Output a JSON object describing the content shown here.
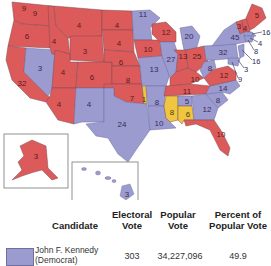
{
  "map": {
    "title": "1960 Presidential Election",
    "colors": {
      "democrat": "#9b9bd0",
      "republican": "#dd5a5a",
      "unpledged": "#f0c640"
    },
    "states": [
      {
        "abbr": "WA",
        "votes": "9",
        "party": "republican"
      },
      {
        "abbr": "OR",
        "votes": "6",
        "party": "republican"
      },
      {
        "abbr": "CA",
        "votes": "32",
        "party": "republican"
      },
      {
        "abbr": "NV",
        "votes": "3",
        "party": "democrat"
      },
      {
        "abbr": "ID",
        "votes": "4",
        "party": "republican"
      },
      {
        "abbr": "MT",
        "votes": "4",
        "party": "republican"
      },
      {
        "abbr": "WY",
        "votes": "3",
        "party": "republican"
      },
      {
        "abbr": "UT",
        "votes": "4",
        "party": "republican"
      },
      {
        "abbr": "CO",
        "votes": "6",
        "party": "republican"
      },
      {
        "abbr": "AZ",
        "votes": "4",
        "party": "republican"
      },
      {
        "abbr": "NM",
        "votes": "4",
        "party": "democrat"
      },
      {
        "abbr": "ND",
        "votes": "4",
        "party": "republican"
      },
      {
        "abbr": "SD",
        "votes": "4",
        "party": "republican"
      },
      {
        "abbr": "NE",
        "votes": "6",
        "party": "republican"
      },
      {
        "abbr": "KS",
        "votes": "8",
        "party": "republican"
      },
      {
        "abbr": "OK",
        "votes": "7",
        "party": "republican"
      },
      {
        "abbr": "OK-unpledged",
        "votes": "1",
        "party": "unpledged"
      },
      {
        "abbr": "TX",
        "votes": "24",
        "party": "democrat"
      },
      {
        "abbr": "MN",
        "votes": "11",
        "party": "democrat"
      },
      {
        "abbr": "IA",
        "votes": "10",
        "party": "republican"
      },
      {
        "abbr": "MO",
        "votes": "13",
        "party": "democrat"
      },
      {
        "abbr": "AR",
        "votes": "8",
        "party": "democrat"
      },
      {
        "abbr": "LA",
        "votes": "10",
        "party": "democrat"
      },
      {
        "abbr": "WI",
        "votes": "12",
        "party": "republican"
      },
      {
        "abbr": "IL",
        "votes": "27",
        "party": "democrat"
      },
      {
        "abbr": "MI",
        "votes": "20",
        "party": "democrat"
      },
      {
        "abbr": "IN",
        "votes": "13",
        "party": "republican"
      },
      {
        "abbr": "OH",
        "votes": "25",
        "party": "republican"
      },
      {
        "abbr": "KY",
        "votes": "10",
        "party": "republican"
      },
      {
        "abbr": "TN",
        "votes": "11",
        "party": "republican"
      },
      {
        "abbr": "MS",
        "votes": "8",
        "party": "unpledged"
      },
      {
        "abbr": "AL",
        "votes": "6",
        "party": "unpledged"
      },
      {
        "abbr": "AL-dem",
        "votes": "5",
        "party": "democrat"
      },
      {
        "abbr": "GA",
        "votes": "12",
        "party": "democrat"
      },
      {
        "abbr": "FL",
        "votes": "10",
        "party": "republican"
      },
      {
        "abbr": "SC",
        "votes": "8",
        "party": "democrat"
      },
      {
        "abbr": "NC",
        "votes": "14",
        "party": "democrat"
      },
      {
        "abbr": "VA",
        "votes": "12",
        "party": "republican"
      },
      {
        "abbr": "WV",
        "votes": "8",
        "party": "democrat"
      },
      {
        "abbr": "PA",
        "votes": "32",
        "party": "democrat"
      },
      {
        "abbr": "NY",
        "votes": "45",
        "party": "democrat"
      },
      {
        "abbr": "VT",
        "votes": "3",
        "party": "republican"
      },
      {
        "abbr": "NH",
        "votes": "4",
        "party": "republican"
      },
      {
        "abbr": "ME",
        "votes": "5",
        "party": "republican"
      },
      {
        "abbr": "MA",
        "votes": "16",
        "party": "democrat"
      },
      {
        "abbr": "RI",
        "votes": "4",
        "party": "democrat"
      },
      {
        "abbr": "CT",
        "votes": "8",
        "party": "democrat"
      },
      {
        "abbr": "NJ",
        "votes": "16",
        "party": "democrat"
      },
      {
        "abbr": "DE",
        "votes": "3",
        "party": "democrat"
      },
      {
        "abbr": "MD",
        "votes": "9",
        "party": "democrat"
      },
      {
        "abbr": "AK",
        "votes": "3",
        "party": "republican"
      },
      {
        "abbr": "HI",
        "votes": "3",
        "party": "democrat"
      }
    ]
  },
  "table": {
    "headers": {
      "candidate": "Candidate",
      "electoral_1": "Electoral",
      "electoral_2": "Vote",
      "popular_1": "Popular",
      "popular_2": "Vote",
      "percent_1": "Percent of",
      "percent_2": "Popular Vote"
    },
    "rows": [
      {
        "candidate_1": "John F. Kennedy",
        "candidate_2": "(Democrat)",
        "electoral": "303",
        "popular": "34,227,096",
        "percent": "49.9",
        "color": "#9b9bd0"
      }
    ]
  }
}
